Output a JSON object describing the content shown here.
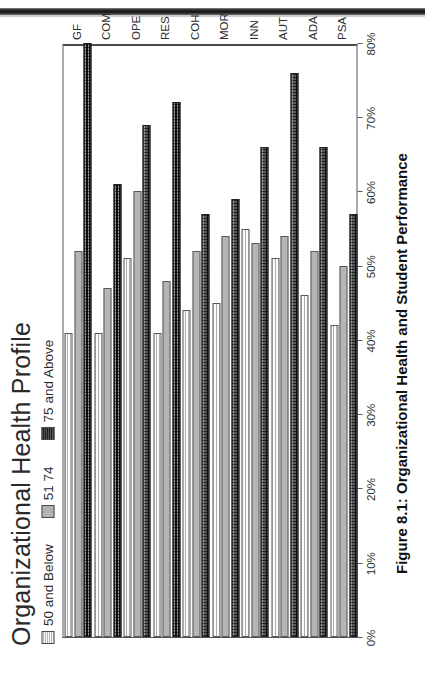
{
  "figure": {
    "title": "Organizational Health Profile",
    "caption": "Figure 8.1:  Organizational Health and Student Performance"
  },
  "legend": {
    "items": [
      {
        "label": "50 and Below",
        "swatch": "light-hatch-swatch",
        "color": "#f0f0f0"
      },
      {
        "label": "51 74",
        "swatch": "mid-gray-swatch",
        "color": "#b3b3b3"
      },
      {
        "label": "75 and Above",
        "swatch": "dark-checker-swatch",
        "color": "#3a3a3a"
      }
    ]
  },
  "axis": {
    "value_ticks": [
      "0%",
      "10%",
      "20%",
      "30%",
      "40%",
      "50%",
      "60%",
      "70%",
      "80%"
    ],
    "value_max": 80,
    "value_min": 0
  },
  "chart_data": {
    "type": "bar",
    "title": "Organizational Health Profile",
    "xlabel": "",
    "ylabel": "",
    "orientation": "horizontal",
    "grid": false,
    "legend_position": "top-left",
    "ylim": [
      0,
      80
    ],
    "tick_labels": [
      "0%",
      "10%",
      "20%",
      "30%",
      "40%",
      "50%",
      "60%",
      "70%",
      "80%"
    ],
    "categories": [
      "GF",
      "COM",
      "OPE",
      "RES",
      "COH",
      "MOR",
      "INN",
      "AUT",
      "ADA",
      "PSA"
    ],
    "series": [
      {
        "name": "50 and Below",
        "values": [
          41,
          41,
          51,
          41,
          44,
          45,
          55,
          51,
          46,
          42
        ]
      },
      {
        "name": "51 74",
        "values": [
          52,
          47,
          60,
          48,
          52,
          54,
          53,
          54,
          52,
          50
        ]
      },
      {
        "name": "75 and Above",
        "values": [
          80,
          61,
          69,
          72,
          57,
          59,
          66,
          76,
          66,
          57
        ]
      }
    ]
  }
}
